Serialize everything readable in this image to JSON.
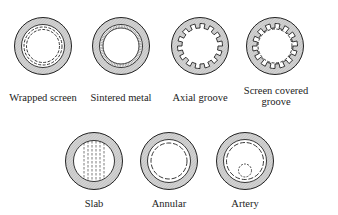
{
  "diagram": {
    "wicks": [
      {
        "id": "wrapped-screen",
        "label": "Wrapped screen",
        "cx": 43,
        "cy": 46
      },
      {
        "id": "sintered-metal",
        "label": "Sintered metal",
        "cx": 121,
        "cy": 46
      },
      {
        "id": "axial-groove",
        "label": "Axial groove",
        "cx": 200,
        "cy": 46
      },
      {
        "id": "screen-covered-groove",
        "label_line1": "Screen covered",
        "label_line2": "groove",
        "cx": 275,
        "cy": 46
      },
      {
        "id": "slab",
        "label": "Slab",
        "cx": 94,
        "cy": 161
      },
      {
        "id": "annular",
        "label": "Annular",
        "cx": 169,
        "cy": 161
      },
      {
        "id": "artery",
        "label": "Artery",
        "cx": 245,
        "cy": 161
      }
    ],
    "colors": {
      "stroke": "#222222",
      "hatch": "#bdbdbd",
      "background": "#ffffff"
    }
  }
}
